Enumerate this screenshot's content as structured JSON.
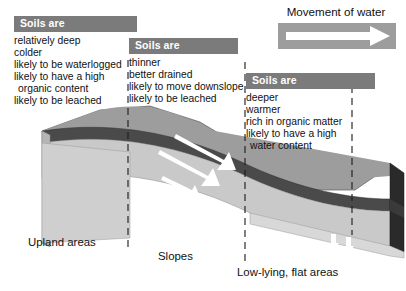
{
  "figure": {
    "background_color": "#ffffff"
  },
  "legend": {
    "title": "Movement of water",
    "swatch_color": "#9d9d9d",
    "arrow_color": "#ffffff",
    "arrow_icon": "right-arrow-icon"
  },
  "callouts": [
    {
      "id": "upland",
      "header": "Soils are",
      "header_color": "#7b7b7b",
      "lines": [
        {
          "text": "relatively deep",
          "indent": false
        },
        {
          "text": "colder",
          "indent": false
        },
        {
          "text": "likely to be waterlogged",
          "indent": false
        },
        {
          "text": "likely to have a high",
          "indent": false
        },
        {
          "text": "organic content",
          "indent": true
        },
        {
          "text": "likely to be leached",
          "indent": false
        }
      ]
    },
    {
      "id": "slopes",
      "header": "Soils are",
      "header_color": "#7b7b7b",
      "lines": [
        {
          "text": "thinner",
          "indent": false
        },
        {
          "text": "better drained",
          "indent": false
        },
        {
          "text": "likely to move downslope",
          "indent": false
        },
        {
          "text": "likely to be leached",
          "indent": false
        }
      ]
    },
    {
      "id": "lowlying",
      "header": "Soils are",
      "header_color": "#7b7b7b",
      "lines": [
        {
          "text": "deeper",
          "indent": false
        },
        {
          "text": "warmer",
          "indent": false
        },
        {
          "text": "rich in organic matter",
          "indent": false
        },
        {
          "text": "likely to have a high",
          "indent": false
        },
        {
          "text": "water content",
          "indent": true
        }
      ]
    }
  ],
  "zone_captions": {
    "upland": "Upland areas",
    "slopes": "Slopes",
    "lowlying": "Low-lying, flat areas"
  },
  "terrain": {
    "surface_color": "#9d9d9d",
    "soil_layer_color": "#4a4a4a",
    "bedrock_face_color": "#cfcfcf",
    "side_face_color": "#6f6f6f",
    "end_face_color": "#262626",
    "divider_style": "dashed",
    "divider_color": "#1a1a1a",
    "water_arrow_color": "#ffffff",
    "water_arrow_icons": [
      "down-arrow-icon",
      "down-arrow-icon",
      "downslope-arrow-icon",
      "downslope-arrow-icon",
      "downslope-arrow-icon",
      "down-arrow-icon",
      "down-arrow-icon"
    ]
  }
}
